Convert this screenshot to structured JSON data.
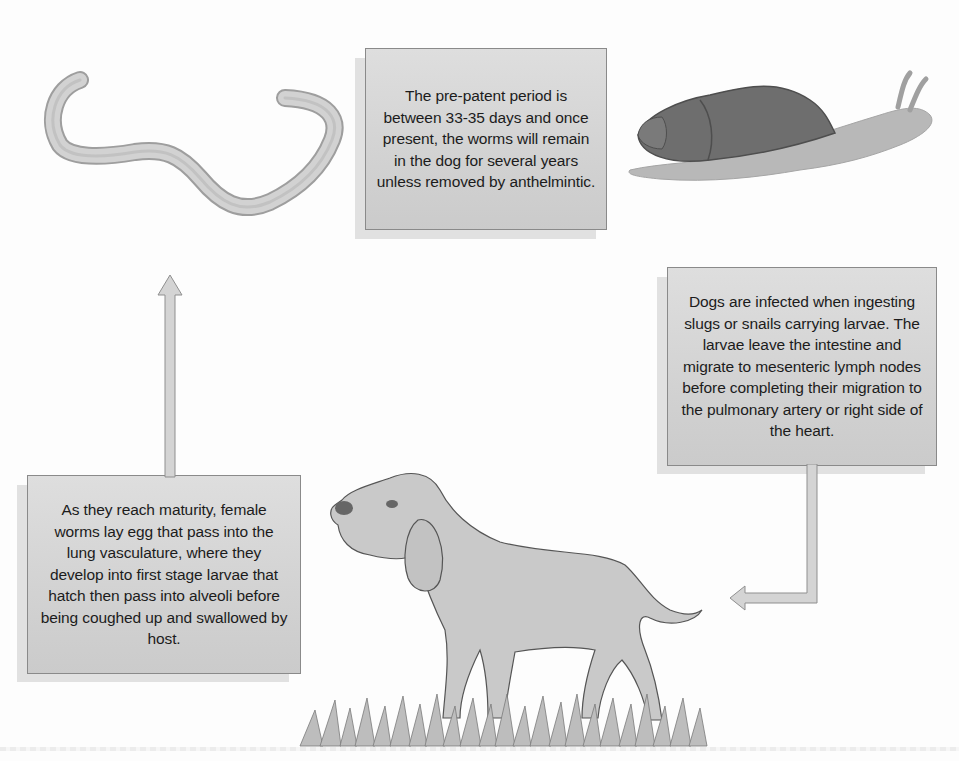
{
  "diagram": {
    "nodes": {
      "prepatent": {
        "text": "The pre-patent period is between 33-35 days and once present, the worms will remain in the dog for several years unless removed by anthelmintic."
      },
      "infection": {
        "text": "Dogs are infected when ingesting slugs or snails carrying larvae. The larvae leave the intestine and migrate to mesenteric lymph nodes before completing their migration to the pulmonary artery or right side of the heart."
      },
      "maturity": {
        "text": "As they reach maturity, female worms lay egg that pass into the lung vasculature, where they develop into first stage larvae that hatch then pass into alveoli before being coughed up and swallowed by host."
      }
    },
    "illustrations": {
      "worm": "worm-illustration",
      "snail": "snail-illustration",
      "dog": "dog-illustration",
      "grass": "grass-illustration"
    },
    "arrows": [
      {
        "from": "infection",
        "to": "dog",
        "direction": "down-left"
      },
      {
        "from": "maturity",
        "to": "worm",
        "direction": "up"
      }
    ],
    "colors": {
      "box_fill": "#d6d6d6",
      "box_border": "#8a8a8a",
      "arrow_fill": "#d4d4d4",
      "text": "#1c1c1c",
      "snail_shell": "#6e6e6e",
      "snail_body": "#b9b9b9",
      "dog_fill": "#c9c9c9",
      "worm_fill": "#cfcfcf"
    }
  }
}
